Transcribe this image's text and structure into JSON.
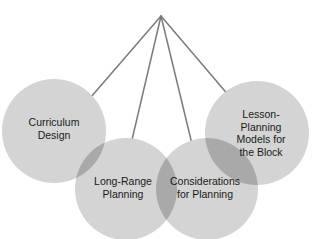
{
  "diagram": {
    "type": "hierarchy-fan",
    "apex": {
      "x": 161,
      "y": 16
    },
    "line_color": "#7a7a7a",
    "circle_fill": "#d4d4d4",
    "overlap_fill": "#a9a9a9",
    "text_color": "#1a1a1a",
    "nodes": [
      {
        "id": "curriculum-design",
        "label": "Curriculum\nDesign",
        "cx": 54,
        "cy": 131,
        "r": 52,
        "line_end": {
          "x": 91,
          "y": 97
        }
      },
      {
        "id": "long-range-planning",
        "label": "Long-Range\nPlanning",
        "cx": 126,
        "cy": 189,
        "r": 51,
        "line_end": {
          "x": 131,
          "y": 144
        }
      },
      {
        "id": "considerations-for-planning",
        "label": "Considerations\nfor Planning",
        "cx": 207,
        "cy": 189,
        "r": 51,
        "line_end": {
          "x": 192,
          "y": 144
        }
      },
      {
        "id": "lesson-planning-models",
        "label": "Lesson-\nPlanning\nModels for\nthe Block",
        "cx": 257,
        "cy": 133,
        "r": 52,
        "line_end": {
          "x": 230,
          "y": 97
        }
      }
    ]
  }
}
